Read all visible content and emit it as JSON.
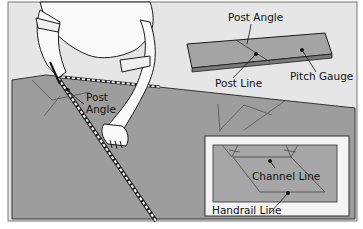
{
  "figure": {
    "type": "diagram",
    "labels": {
      "post_angle_top": "Post Angle",
      "post_line": "Post Line",
      "pitch_gauge": "Pitch Gauge",
      "post_angle_left_1": "Post",
      "post_angle_left_2": "Angle",
      "channel_line": "Channel Line",
      "handrail_line": "Handrail Line"
    },
    "colors": {
      "background": "#e6e6e6",
      "surface_gray": "#9d9d9d",
      "gauge_gray": "#a4a4a4",
      "inset_bg": "#f4f4f4",
      "line": "#1a1a1a",
      "border": "#333333"
    },
    "parts": [
      "person-kneeling-marking",
      "tape-measure",
      "pitch-gauge-board",
      "inset-detail"
    ]
  }
}
